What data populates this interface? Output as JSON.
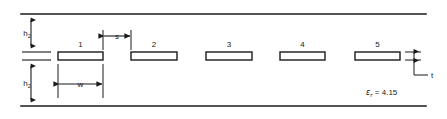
{
  "figure": {
    "type": "cross-section-diagram",
    "background_color": "#ffffff",
    "line_color": "#1a1a1a",
    "strip_fill": "#ffffff"
  },
  "boundaries": {
    "top_line_label": "top ground plane",
    "bottom_line_label": "bottom ground plane",
    "center_reference_label": "substrate interface"
  },
  "dimensions": [
    {
      "id": "h2-top",
      "symbol": "h",
      "subscript": "2",
      "display": "h2",
      "orientation": "vertical",
      "position": "upper-left"
    },
    {
      "id": "h2-bottom",
      "symbol": "h",
      "subscript": "2",
      "display": "h2",
      "orientation": "vertical",
      "position": "lower-left"
    },
    {
      "id": "s",
      "symbol": "s",
      "subscript": "",
      "display": "s",
      "orientation": "horizontal",
      "position": "between-strip-1-and-2"
    },
    {
      "id": "w",
      "symbol": "w",
      "subscript": "",
      "display": "w",
      "orientation": "horizontal",
      "position": "below-strip-1"
    },
    {
      "id": "t",
      "symbol": "t",
      "subscript": "",
      "display": "t",
      "orientation": "vertical",
      "position": "right-of-strip-5"
    }
  ],
  "strips": [
    {
      "label": "1",
      "x": 58,
      "y": 52,
      "width": 45,
      "height": 8
    },
    {
      "label": "2",
      "x": 131,
      "y": 52,
      "width": 46,
      "height": 8
    },
    {
      "label": "3",
      "x": 206,
      "y": 52,
      "width": 46,
      "height": 8
    },
    {
      "label": "4",
      "x": 280,
      "y": 52,
      "width": 45,
      "height": 8
    },
    {
      "label": "5",
      "x": 355,
      "y": 52,
      "width": 45,
      "height": 8
    }
  ],
  "annotations": {
    "permittivity": {
      "symbol": "ε",
      "subscript": "r",
      "equals": " = ",
      "value": "4.15",
      "full_text": "εr = 4.15"
    }
  }
}
